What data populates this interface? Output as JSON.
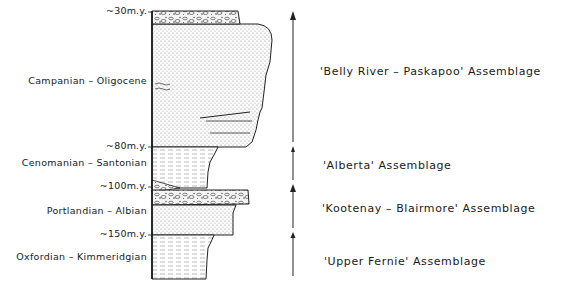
{
  "figure": {
    "type": "stratigraphic-column",
    "age_markers": [
      {
        "label": "~30m.y.",
        "y": 12
      },
      {
        "label": "~80m.y.",
        "y": 147
      },
      {
        "label": "~100m.y.",
        "y": 187
      },
      {
        "label": "~150m.y.",
        "y": 235
      }
    ],
    "stage_labels": [
      {
        "label": "Campanian – Oligocene",
        "y": 82
      },
      {
        "label": "Cenomanian – Santonian",
        "y": 163
      },
      {
        "label": "Portlandian – Albian",
        "y": 212
      },
      {
        "label": "Oxfordian – Kimmeridgian",
        "y": 258
      }
    ],
    "assemblages": [
      {
        "label": "'Belly River – Paskapoo' Assemblage",
        "y": 73
      },
      {
        "label": "'Alberta' Assemblage",
        "y": 167
      },
      {
        "label": "'Kootenay – Blairmore' Assemblage",
        "y": 210
      },
      {
        "label": "'Upper Fernie' Assemblage",
        "y": 263
      }
    ],
    "lithology_units": [
      {
        "name": "conglomerate-top",
        "from_y": 11,
        "to_y": 24,
        "pattern": "conglomerate"
      },
      {
        "name": "sandstone-upper",
        "from_y": 24,
        "to_y": 147,
        "pattern": "sandstone"
      },
      {
        "name": "shale-alberta",
        "from_y": 147,
        "to_y": 187,
        "pattern": "shale"
      },
      {
        "name": "conglomerate-kootenay",
        "from_y": 190,
        "to_y": 205,
        "pattern": "conglomerate"
      },
      {
        "name": "sandstone-kootenay",
        "from_y": 205,
        "to_y": 235,
        "pattern": "sandstone"
      },
      {
        "name": "shale-fernie",
        "from_y": 235,
        "to_y": 279,
        "pattern": "shale"
      }
    ],
    "arrow_segments": [
      {
        "from_y": 276,
        "to_y": 233
      },
      {
        "from_y": 228,
        "to_y": 185
      },
      {
        "from_y": 180,
        "to_y": 147
      },
      {
        "from_y": 142,
        "to_y": 12
      }
    ]
  }
}
